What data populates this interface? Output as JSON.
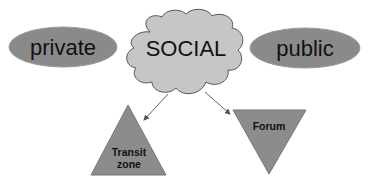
{
  "diagram": {
    "nodes": {
      "private": {
        "label": "private",
        "shape": "ellipse",
        "fill": "#8a8a8a"
      },
      "social": {
        "label": "SOCIAL",
        "shape": "cloud",
        "fill": "#c6c6c6"
      },
      "public": {
        "label": "public",
        "shape": "ellipse",
        "fill": "#8a8a8a"
      },
      "transit_zone": {
        "label_line1": "Transit",
        "label_line2": "zone",
        "shape": "triangle-up",
        "fill": "#8c8c8c"
      },
      "forum": {
        "label": "Forum",
        "shape": "triangle-down",
        "fill": "#8c8c8c"
      }
    },
    "edges": [
      {
        "from": "SOCIAL",
        "to": "Transit zone",
        "type": "arrow"
      },
      {
        "from": "SOCIAL",
        "to": "Forum",
        "type": "arrow"
      }
    ],
    "colors": {
      "stroke": "#555555",
      "text": "#111111",
      "arrow": "#666666"
    }
  }
}
